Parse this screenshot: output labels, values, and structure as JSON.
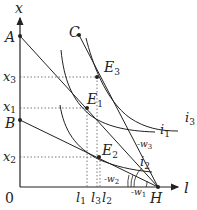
{
  "diagram": {
    "axes": {
      "x_label": "l",
      "y_label": "x",
      "origin": "0"
    },
    "points": {
      "A": "A",
      "B": "B",
      "C": "C",
      "H": "H",
      "E1": {
        "base": "E",
        "sub": "1"
      },
      "E2": {
        "base": "E",
        "sub": "2"
      },
      "E3": {
        "base": "E",
        "sub": "3"
      }
    },
    "y_ticks": [
      {
        "base": "x",
        "sub": "3"
      },
      {
        "base": "x",
        "sub": "1"
      },
      {
        "base": "x",
        "sub": "2"
      }
    ],
    "x_ticks": [
      {
        "base": "l",
        "sub": "1"
      },
      {
        "base": "l",
        "sub": "3"
      },
      {
        "base": "l",
        "sub": "2"
      }
    ],
    "curves": [
      {
        "base": "i",
        "sub": "3"
      },
      {
        "base": "i",
        "sub": "1"
      },
      {
        "base": "i",
        "sub": "2"
      }
    ],
    "wage_labels": [
      {
        "base": "-w",
        "sub": "3"
      },
      {
        "base": "-w",
        "sub": "2"
      },
      {
        "base": "-w",
        "sub": "1"
      }
    ],
    "colors": {
      "line": "#222222",
      "dotted": "#555555",
      "background": "#ffffff"
    }
  }
}
